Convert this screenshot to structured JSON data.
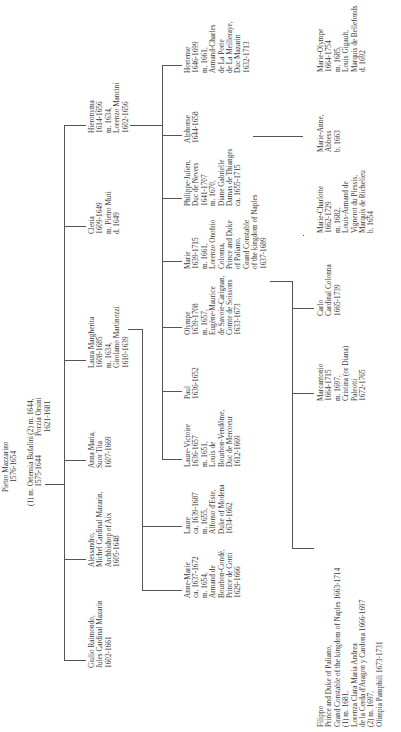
{
  "root": {
    "lines": [
      "Pietro Mazzarino",
      "1576-1654"
    ]
  },
  "marriages": {
    "first": {
      "lines": [
        "(1) m. Ortensia Bufalini",
        "1575-1644"
      ]
    },
    "second": {
      "lines": [
        "(2) m. 1644,",
        "Porzia Orsini",
        "1621-1681"
      ]
    }
  },
  "generation2": [
    {
      "id": "giulio",
      "lines": [
        "Giulio Raimondo,",
        "Jules Cardinal Mazarin",
        "1602-1661"
      ]
    },
    {
      "id": "alessandro",
      "lines": [
        "Alessandro,",
        "Michel Cardinal Mazarin,",
        "Archbishop of Aix",
        "1605-1648"
      ]
    },
    {
      "id": "anna-maria",
      "lines": [
        "Anna Maria,",
        "Suor Tita",
        "1607-1669"
      ]
    },
    {
      "id": "laura-margherita",
      "lines": [
        "Laura Margherita",
        "1608-1685",
        "m. 1634,",
        "Girolamo Martinozzi",
        "1610-1639"
      ]
    },
    {
      "id": "cleria",
      "lines": [
        "Cleria",
        "1609-1649",
        "m. Pietro Muti",
        "d. 1649"
      ]
    },
    {
      "id": "hieronyma",
      "lines": [
        "Hieronyma",
        "1614-1656",
        "m. 1634,",
        "Lorenzo Mancini",
        "1602-1656"
      ]
    }
  ],
  "generation3": [
    {
      "id": "anne-marie",
      "lines": [
        "Anne-Marie",
        "ca. 1637-1672",
        "m. 1654,",
        "Armand de",
        "Bourbon-Condé,",
        "Prince de Conti",
        "1629-1666"
      ]
    },
    {
      "id": "laure",
      "lines": [
        "Laure",
        "ca. 1639-1687",
        "m. 1655,",
        "Alfonso d'Este,",
        "Duke of Modena",
        "1634-1662"
      ]
    },
    {
      "id": "laure-victoire",
      "lines": [
        "Laure-Victoire",
        "1636-1657",
        "m. 1651,",
        "Louis de",
        "Bourbon-Vendôme,",
        "Duc de Mercoeur",
        "1612-1669"
      ]
    },
    {
      "id": "paul",
      "lines": [
        "Paul",
        "1636-1652"
      ]
    },
    {
      "id": "olympe",
      "lines": [
        "Olympe",
        "1639-1708",
        "m. 1657,",
        "Eugène-Maurice",
        "de Savoie-Carignan,",
        "Comte de Soissons",
        "1633-1673"
      ]
    },
    {
      "id": "marie",
      "lines": [
        "Marie",
        "1639-1715",
        "m. 1661,",
        "Lorenzo Onofrio",
        "Colonna,",
        "Prince and Duke",
        "of Paliano,",
        "Grand Constable",
        "of the kingdom of Naples",
        "1637-1689"
      ]
    },
    {
      "id": "philippe-julien",
      "lines": [
        "Philippe-Julien,",
        "Duc de Nevers",
        "1641-1707",
        "m. 1670,",
        "Diane Gabrielle",
        "Damas de Thianges",
        "ca. 1655-1715"
      ]
    },
    {
      "id": "alphonse",
      "lines": [
        "Alphonse",
        "1644-1658"
      ]
    },
    {
      "id": "hortense",
      "lines": [
        "Hortense",
        "1646-1699",
        "m. 1661,",
        "Armand-Charles",
        "de La Porte",
        "de La Meilleraye,",
        "Duc Mazarin",
        "1632-1713"
      ]
    },
    {
      "id": "marie-anne",
      "lines": [
        "Marie-Anne",
        "1649-1714",
        "m. 1662,",
        "Maurice-Godefroy",
        "de La Tour",
        "d'Auvergne,",
        "Duc de Bouillon",
        "1636-1721"
      ]
    }
  ],
  "generation4": [
    {
      "id": "filippo",
      "lines": [
        "Filippo",
        "Prince and Duke of Paliano,",
        "Grand Constable of the kingdom of Naples 1663-1714",
        "(1) m. 1681,",
        "Lorenza Clara Maria Andrea",
        "de la Cerda d'Aragon y Cardona 1666-1697",
        "(2) m. 1697,",
        "Olimpia Pamphili 1673-1731"
      ]
    },
    {
      "id": "marcantonio",
      "lines": [
        "Marcantonio",
        "1664-1715",
        "m. 1697,",
        "Cristina (or Diana)",
        "Paleotti",
        "1672-1765"
      ]
    },
    {
      "id": "carlo",
      "lines": [
        "Carlo",
        "Cardinal Colonna",
        "1665-1739"
      ]
    },
    {
      "id": "marie-charlotte",
      "lines": [
        "Marie-Charlotte",
        "1662-1729",
        "m. 1682,",
        "Louis-Armand de",
        "Vignerot du Plessis,",
        "Marquis de Richelieu",
        "b. 1654"
      ]
    },
    {
      "id": "marie-anne-abbess",
      "lines": [
        "Marie-Anne,",
        "Abbess",
        "b. 1663"
      ]
    },
    {
      "id": "marie-olympe",
      "lines": [
        "Marie-Olympe",
        "1664-1754",
        "m. 1685,",
        "Louis Gigault,",
        "Marquis de Bellefonds",
        "d. 1692"
      ]
    },
    {
      "id": "paul-jules",
      "lines": [
        "Paul-Jules,",
        "Duc Mazarin",
        "1666-1731",
        "m. 1685,",
        "Charlotte Félicité",
        "de Durfort",
        "1672-1730"
      ]
    }
  ]
}
